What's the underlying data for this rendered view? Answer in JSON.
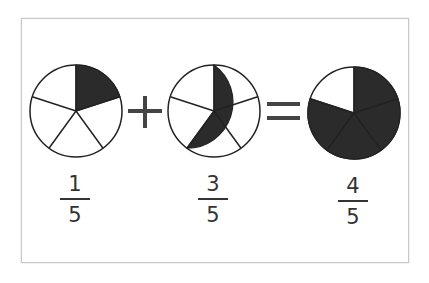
{
  "diagram": {
    "operators": {
      "plus": "+",
      "equals": "="
    },
    "colors": {
      "filled": "#2b2b2b",
      "empty": "#ffffff",
      "stroke": "#222222",
      "operator": "#444444",
      "frame": "#c8c8c8"
    },
    "terms": [
      {
        "role": "addend-1",
        "numerator": "1",
        "denominator": "5",
        "slices_total": 5,
        "slices_shaded": 1
      },
      {
        "role": "addend-2",
        "numerator": "3",
        "denominator": "5",
        "slices_total": 5,
        "slices_shaded": 3
      },
      {
        "role": "sum",
        "numerator": "4",
        "denominator": "5",
        "slices_total": 5,
        "slices_shaded": 4
      }
    ]
  }
}
